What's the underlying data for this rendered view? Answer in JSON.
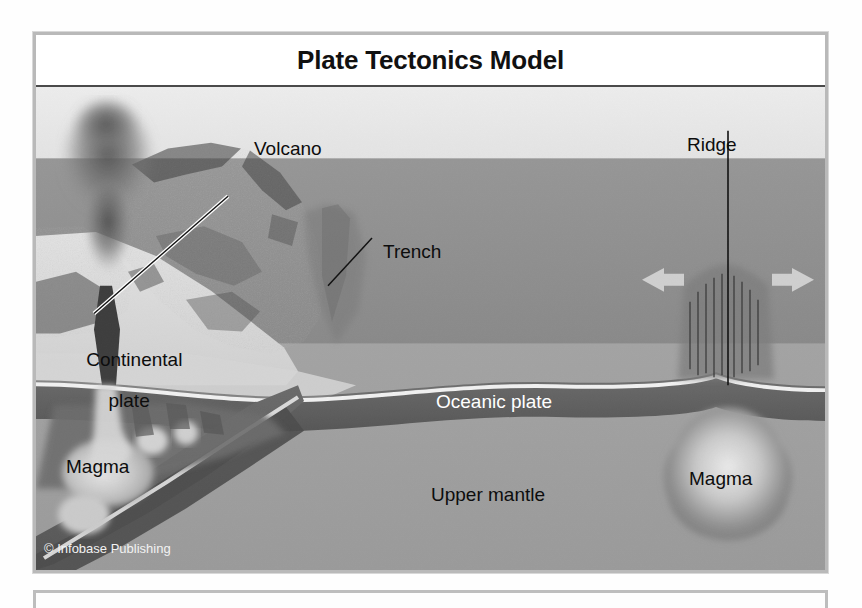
{
  "figure": {
    "title": "Plate Tectonics Model",
    "credit": "© Infobase Publishing",
    "labels": {
      "volcano": "Volcano",
      "trench": "Trench",
      "ridge": "Ridge",
      "continental_plate": "Continental\nplate",
      "continental_plate_line1": "Continental",
      "continental_plate_line2": "plate",
      "magma_left": "Magma",
      "magma_right": "Magma",
      "oceanic_plate": "Oceanic plate",
      "upper_mantle": "Upper mantle"
    },
    "colors": {
      "frame_border": "#b9b9b9",
      "title_rule": "#4a4a4a",
      "sky": "#e9e9e9",
      "water": "#8f8f8f",
      "crust_dark": "#5e5e5e",
      "mantle": "#9d9d9d",
      "continent_light": "#d8d8d8",
      "arrow": "#c9c9c9",
      "label_dark": "#0d0d0d",
      "label_light": "#ffffff"
    },
    "arrows": [
      {
        "name": "spreading-arrow-left",
        "direction": "left"
      },
      {
        "name": "spreading-arrow-right",
        "direction": "right"
      }
    ]
  }
}
